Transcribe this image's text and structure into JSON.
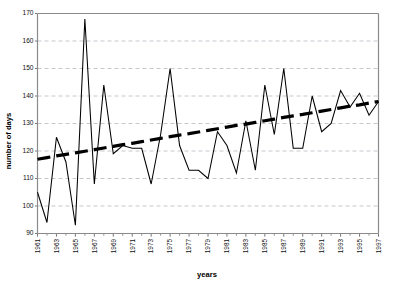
{
  "chart_data": {
    "type": "line",
    "title": "",
    "xlabel": "years",
    "ylabel": "number of days",
    "ylim": [
      90,
      170
    ],
    "xlim": [
      1961,
      1997
    ],
    "ytick_labels": [
      "90",
      "100",
      "110",
      "120",
      "130",
      "140",
      "150",
      "160",
      "170"
    ],
    "ytick_values": [
      90,
      100,
      110,
      120,
      130,
      140,
      150,
      160,
      170
    ],
    "grid": "horizontal-dashed",
    "legend": "none",
    "x": [
      1961,
      1962,
      1963,
      1964,
      1965,
      1966,
      1967,
      1968,
      1969,
      1970,
      1971,
      1972,
      1973,
      1974,
      1975,
      1976,
      1977,
      1978,
      1979,
      1980,
      1981,
      1982,
      1983,
      1984,
      1985,
      1986,
      1987,
      1988,
      1989,
      1990,
      1991,
      1992,
      1993,
      1994,
      1995,
      1996,
      1997
    ],
    "xtick_labels": [
      "1961",
      "1963",
      "1965",
      "1967",
      "1969",
      "1971",
      "1973",
      "1975",
      "1977",
      "1979",
      "1981",
      "1983",
      "1985",
      "1987",
      "1989",
      "1991",
      "1993",
      "1995",
      "1997"
    ],
    "series": [
      {
        "name": "number of days",
        "style": "solid-thin-black",
        "values": [
          105,
          94,
          125,
          116,
          93,
          168,
          108,
          144,
          119,
          122,
          121,
          121,
          108,
          126,
          150,
          122,
          113,
          113,
          110,
          127,
          122,
          112,
          131,
          113,
          144,
          126,
          150,
          121,
          121,
          140,
          127,
          130,
          142,
          136,
          141,
          133,
          138
        ]
      },
      {
        "name": "linear trend",
        "style": "dashed-thick-black",
        "values": [
          117,
          117.6,
          118.2,
          118.8,
          119.3,
          119.9,
          120.5,
          121.1,
          121.7,
          122.3,
          122.8,
          123.4,
          124.0,
          124.6,
          125.2,
          125.8,
          126.3,
          126.9,
          127.5,
          128.1,
          128.7,
          129.3,
          129.8,
          130.4,
          131.0,
          131.6,
          132.2,
          132.8,
          133.3,
          133.9,
          134.5,
          135.1,
          135.7,
          136.3,
          136.8,
          137.4,
          138
        ]
      }
    ]
  },
  "colors": {
    "series": "#000000",
    "trend": "#000000",
    "grid": "#b9b9c4",
    "axis": "#8a8a8a",
    "background": "#ffffff"
  }
}
